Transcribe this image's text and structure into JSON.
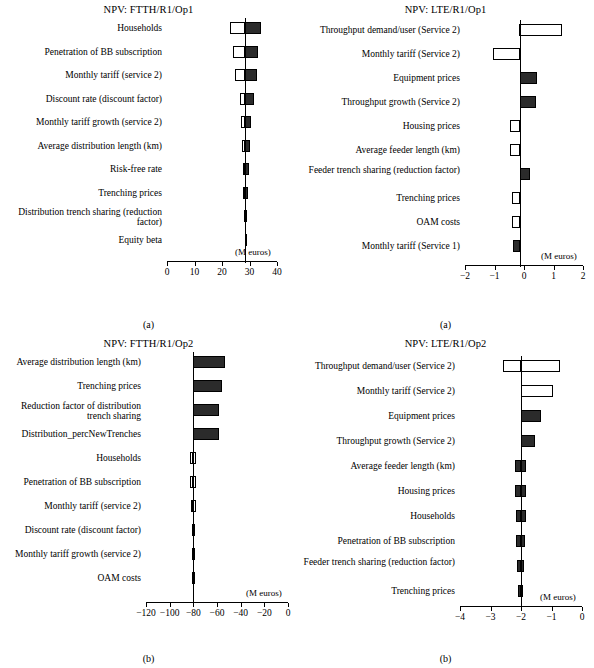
{
  "figure": {
    "units_label": "(M euros)"
  },
  "panels": [
    {
      "id": "a-left",
      "caption": "(a)",
      "chart_index": 0
    },
    {
      "id": "a-right",
      "caption": "(a)",
      "chart_index": 1
    },
    {
      "id": "b-left",
      "caption": "(b)",
      "chart_index": 2
    },
    {
      "id": "b-right",
      "caption": "(b)",
      "chart_index": 3
    }
  ],
  "chart_data": [
    {
      "type": "bar",
      "orientation": "horizontal",
      "title": "NPV: FTTH/R1/Op1",
      "xlabel": "(M euros)",
      "ylabel": "",
      "xlim": [
        0,
        40
      ],
      "xticks": [
        0,
        10,
        20,
        30,
        40
      ],
      "xticklabels": [
        "0",
        "10",
        "20",
        "30",
        "40"
      ],
      "base": 28.5,
      "categories": [
        "Households",
        "Penetration of BB subscription",
        "Monthly tariff (service 2)",
        "Discount rate (discount factor)",
        "Monthly tariff growth (service 2)",
        "Average distribution length (km)",
        "Risk-free rate",
        "Trenching prices",
        "Distribution trench sharing (reduction factor)",
        "Equity beta"
      ],
      "bars": [
        {
          "low": 23.0,
          "high": 34.3,
          "fill": "dark-right"
        },
        {
          "low": 24.0,
          "high": 33.2,
          "fill": "dark-right"
        },
        {
          "low": 24.6,
          "high": 32.6,
          "fill": "dark-right"
        },
        {
          "low": 26.5,
          "high": 31.5,
          "fill": "dark-right"
        },
        {
          "low": 27.0,
          "high": 30.5,
          "fill": "dark-right"
        },
        {
          "low": 27.2,
          "high": 30.0,
          "fill": "dark-right"
        },
        {
          "low": 27.5,
          "high": 29.7,
          "fill": "dark-right"
        },
        {
          "low": 27.7,
          "high": 29.5,
          "fill": "dark-right"
        },
        {
          "low": 27.9,
          "high": 29.2,
          "fill": "dark-right"
        },
        {
          "low": 28.2,
          "high": 28.9,
          "fill": "dark-right"
        }
      ],
      "grid": false,
      "legend": "none"
    },
    {
      "type": "bar",
      "orientation": "horizontal",
      "title": "NPV: LTE/R1/Op1",
      "xlabel": "(M euros)",
      "ylabel": "",
      "xlim": [
        -2,
        2
      ],
      "xticks": [
        -2,
        -1,
        0,
        1,
        2
      ],
      "xticklabels": [
        "−2",
        "−1",
        "0",
        "1",
        "2"
      ],
      "base": -0.15,
      "categories": [
        "Throughput demand/user (Service 2)",
        "Monthly tariff (Service 2)",
        "Equipment prices",
        "Throughput growth (Service 2)",
        "Housing prices",
        "Average feeder length (km)",
        "Feeder trench sharing (reduction factor)",
        "Trenching prices",
        "OAM costs",
        "Monthly tariff (Service 1)"
      ],
      "bars": [
        {
          "low": -0.18,
          "high": 1.3,
          "fill": "open"
        },
        {
          "low": -1.05,
          "high": -0.15,
          "fill": "open"
        },
        {
          "low": -0.15,
          "high": 0.45,
          "fill": "dark"
        },
        {
          "low": -0.15,
          "high": 0.42,
          "fill": "dark"
        },
        {
          "low": -0.48,
          "high": -0.15,
          "fill": "open"
        },
        {
          "low": -0.48,
          "high": -0.15,
          "fill": "open"
        },
        {
          "low": -0.15,
          "high": 0.2,
          "fill": "dark"
        },
        {
          "low": -0.4,
          "high": -0.15,
          "fill": "open"
        },
        {
          "low": -0.4,
          "high": -0.15,
          "fill": "open"
        },
        {
          "low": -0.38,
          "high": -0.15,
          "fill": "dark"
        }
      ],
      "grid": false,
      "legend": "none"
    },
    {
      "type": "bar",
      "orientation": "horizontal",
      "title": "NPV: FTTH/R1/Op2",
      "xlabel": "(M euros)",
      "ylabel": "",
      "xlim": [
        -120,
        0
      ],
      "xticks": [
        -120,
        -100,
        -80,
        -60,
        -40,
        -20,
        0
      ],
      "xticklabels": [
        "−120",
        "−100",
        "−80",
        "−60",
        "−40",
        "−20",
        "0"
      ],
      "base": -80.0,
      "categories": [
        "Average distribution length (km)",
        "Trenching prices",
        "Reduction factor of distribution trench sharing",
        "Distribution_percNewTrenches",
        "Households",
        "Penetration of BB subscription",
        "Monthly tariff (service 2)",
        "Discount rate (discount factor)",
        "Monthly tariff growth (service 2)",
        "OAM costs"
      ],
      "bars": [
        {
          "low": -80.0,
          "high": -53.0,
          "fill": "dark"
        },
        {
          "low": -80.0,
          "high": -56.0,
          "fill": "dark"
        },
        {
          "low": -80.0,
          "high": -58.0,
          "fill": "dark"
        },
        {
          "low": -80.0,
          "high": -58.5,
          "fill": "dark"
        },
        {
          "low": -82.5,
          "high": -77.5,
          "fill": "open"
        },
        {
          "low": -82.5,
          "high": -78.0,
          "fill": "open"
        },
        {
          "low": -82.0,
          "high": -78.0,
          "fill": "open"
        },
        {
          "low": -81.5,
          "high": -79.0,
          "fill": "dark"
        },
        {
          "low": -81.0,
          "high": -79.0,
          "fill": "open"
        },
        {
          "low": -81.0,
          "high": -79.5,
          "fill": "dark"
        }
      ],
      "grid": false,
      "legend": "none"
    },
    {
      "type": "bar",
      "orientation": "horizontal",
      "title": "NPV: LTE/R1/Op2",
      "xlabel": "(M euros)",
      "ylabel": "",
      "xlim": [
        -4,
        0
      ],
      "xticks": [
        -4,
        -3,
        -2,
        -1,
        0
      ],
      "xticklabels": [
        "−4",
        "−3",
        "−2",
        "−1",
        "0"
      ],
      "base": -2.0,
      "categories": [
        "Throughput demand/user (Service 2)",
        "Monthly tariff (Service 2)",
        "Equipment prices",
        "Throughput growth (Service 2)",
        "Average feeder length (km)",
        "Housing prices",
        "Households",
        "Penetration of BB subscription",
        "Feeder trench sharing (reduction factor)",
        "Trenching prices"
      ],
      "bars": [
        {
          "low": -2.6,
          "high": -0.72,
          "fill": "open"
        },
        {
          "low": -2.0,
          "high": -0.95,
          "fill": "open"
        },
        {
          "low": -2.0,
          "high": -1.35,
          "fill": "dark"
        },
        {
          "low": -2.0,
          "high": -1.55,
          "fill": "dark"
        },
        {
          "low": -2.2,
          "high": -1.85,
          "fill": "dark"
        },
        {
          "low": -2.2,
          "high": -1.85,
          "fill": "dark"
        },
        {
          "low": -2.15,
          "high": -1.85,
          "fill": "dark"
        },
        {
          "low": -2.15,
          "high": -1.88,
          "fill": "dark"
        },
        {
          "low": -2.12,
          "high": -1.9,
          "fill": "dark"
        },
        {
          "low": -2.1,
          "high": -1.92,
          "fill": "dark"
        }
      ],
      "grid": false,
      "legend": "none"
    }
  ]
}
